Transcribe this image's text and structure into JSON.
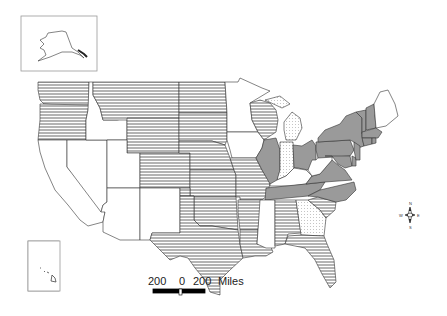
{
  "map": {
    "title": "",
    "categories": [
      {
        "id": "horizontal",
        "pattern": "horizontal-lines",
        "states": [
          "WA",
          "OR",
          "MT",
          "WY",
          "ND",
          "SD",
          "NE",
          "KS",
          "CO",
          "OK",
          "TX",
          "MO",
          "AR",
          "LA",
          "AL",
          "FL",
          "SC",
          "WI"
        ]
      },
      {
        "id": "solid",
        "pattern": "solid-gray",
        "color": "#9a9a9a",
        "states": [
          "IL",
          "OH",
          "PA",
          "NY",
          "VT",
          "NH",
          "MA",
          "CT",
          "RI",
          "NJ",
          "DE",
          "MD",
          "VA",
          "NC",
          "TN"
        ]
      },
      {
        "id": "dotted",
        "pattern": "dotted",
        "states": [
          "MI",
          "IN",
          "GA"
        ]
      },
      {
        "id": "blank",
        "pattern": "none",
        "states": [
          "CA",
          "NV",
          "ID",
          "UT",
          "AZ",
          "NM",
          "MN",
          "IA",
          "MS",
          "KY",
          "WV",
          "ME",
          "AK",
          "HI"
        ]
      }
    ],
    "insets": {
      "alaska": "Alaska inset",
      "hawaii": "Hawaii inset"
    },
    "scale_bar": {
      "left": "200",
      "center": "0",
      "right": "200",
      "unit": "Miles"
    },
    "compass": {
      "n": "N",
      "s": "S",
      "e": "E",
      "w": "W"
    }
  }
}
